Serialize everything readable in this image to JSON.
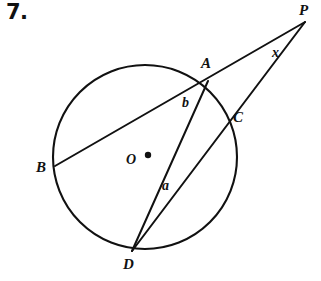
{
  "figure": {
    "problem_number": "7.",
    "background_color": "#ffffff",
    "stroke_color": "#111111",
    "width": 321,
    "height": 281,
    "circle": {
      "center_label": "O",
      "center_x": 145,
      "center_y": 157,
      "radius": 92,
      "center_dot_x": 148,
      "center_dot_y": 155,
      "center_dot_radius": 3.2
    },
    "points": [
      {
        "id": "A",
        "label": "A",
        "x": 208,
        "y": 81,
        "on_circle": true
      },
      {
        "id": "B",
        "label": "B",
        "x": 55,
        "y": 166,
        "on_circle": true
      },
      {
        "id": "C",
        "label": "C",
        "x": 227,
        "y": 116,
        "on_circle": true
      },
      {
        "id": "D",
        "label": "D",
        "x": 132,
        "y": 251,
        "on_circle": true
      },
      {
        "id": "P",
        "label": "P",
        "x": 305,
        "y": 22,
        "on_circle": false
      },
      {
        "id": "O",
        "label": "O",
        "x": 145,
        "y": 157,
        "on_circle": false
      }
    ],
    "segments": [
      {
        "id": "PB",
        "label": "",
        "from": "P",
        "to": "B",
        "x1": 305,
        "y1": 22,
        "x2": 55,
        "y2": 166
      },
      {
        "id": "PD",
        "label": "",
        "from": "P",
        "to": "D",
        "x1": 305,
        "y1": 22,
        "x2": 132,
        "y2": 251
      },
      {
        "id": "AD",
        "label": "",
        "from": "A",
        "to": "D",
        "x1": 208,
        "y1": 81,
        "x2": 132,
        "y2": 251
      }
    ],
    "annotations": [
      {
        "id": "x",
        "label": "x",
        "meaning": "angle-at-P",
        "x": 277,
        "y": 53
      },
      {
        "id": "a",
        "label": "a",
        "meaning": "arc-or-chord-a",
        "x": 167,
        "y": 186
      },
      {
        "id": "b",
        "label": "b",
        "meaning": "arc-or-chord-b",
        "x": 187,
        "y": 103
      }
    ]
  }
}
